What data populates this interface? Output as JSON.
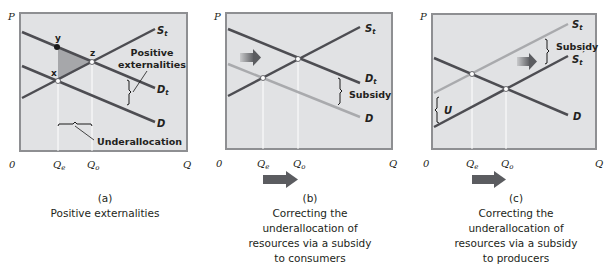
{
  "colors": {
    "plot_bg": "#e1e2e4",
    "plot_border": "#8e8f92",
    "curve_dark": "#4d4d52",
    "curve_light": "#a9aaad",
    "shaded_triangle": "#a6a7aa",
    "arrow": "#5b5c60",
    "text": "#231f20"
  },
  "panels": [
    {
      "id": "a",
      "letter": "(a)",
      "caption_lines": [
        "Positive externalities"
      ],
      "axis": {
        "y_label": "P",
        "x_label": "Q",
        "origin": "0",
        "qe": "Q",
        "qe_sub": "e",
        "qo": "Q",
        "qo_sub": "o"
      },
      "curves": {
        "supply": "S",
        "supply_sub": "t",
        "demand_total": "D",
        "demand_total_sub": "t",
        "demand": "D"
      },
      "points": {
        "x": "x",
        "y": "y",
        "z": "z"
      },
      "annotations": {
        "positive_externalities_1": "Positive",
        "positive_externalities_2": "externalities",
        "underallocation": "Underallocation"
      }
    },
    {
      "id": "b",
      "letter": "(b)",
      "caption_lines": [
        "Correcting the",
        "underallocation of",
        "resources via a subsidy",
        "to consumers"
      ],
      "axis": {
        "y_label": "P",
        "x_label": "Q",
        "origin": "0",
        "qe": "Q",
        "qe_sub": "e",
        "qo": "Q",
        "qo_sub": "o"
      },
      "curves": {
        "supply": "S",
        "supply_sub": "t",
        "demand_total": "D",
        "demand_total_sub": "t",
        "demand": "D"
      },
      "annotations": {
        "subsidy": "Subsidy"
      }
    },
    {
      "id": "c",
      "letter": "(c)",
      "caption_lines": [
        "Correcting the",
        "underallocation of",
        "resources via a subsidy",
        "to producers"
      ],
      "axis": {
        "y_label": "P",
        "x_label": "Q",
        "origin": "0",
        "qe": "Q",
        "qe_sub": "e",
        "qo": "Q",
        "qo_sub": "o"
      },
      "curves": {
        "supply": "S",
        "supply_sub": "t",
        "supply_new": "S",
        "supply_new_sub": "t",
        "supply_new_prime": "′",
        "demand": "D"
      },
      "annotations": {
        "subsidy": "Subsidy",
        "u": "U"
      }
    }
  ]
}
